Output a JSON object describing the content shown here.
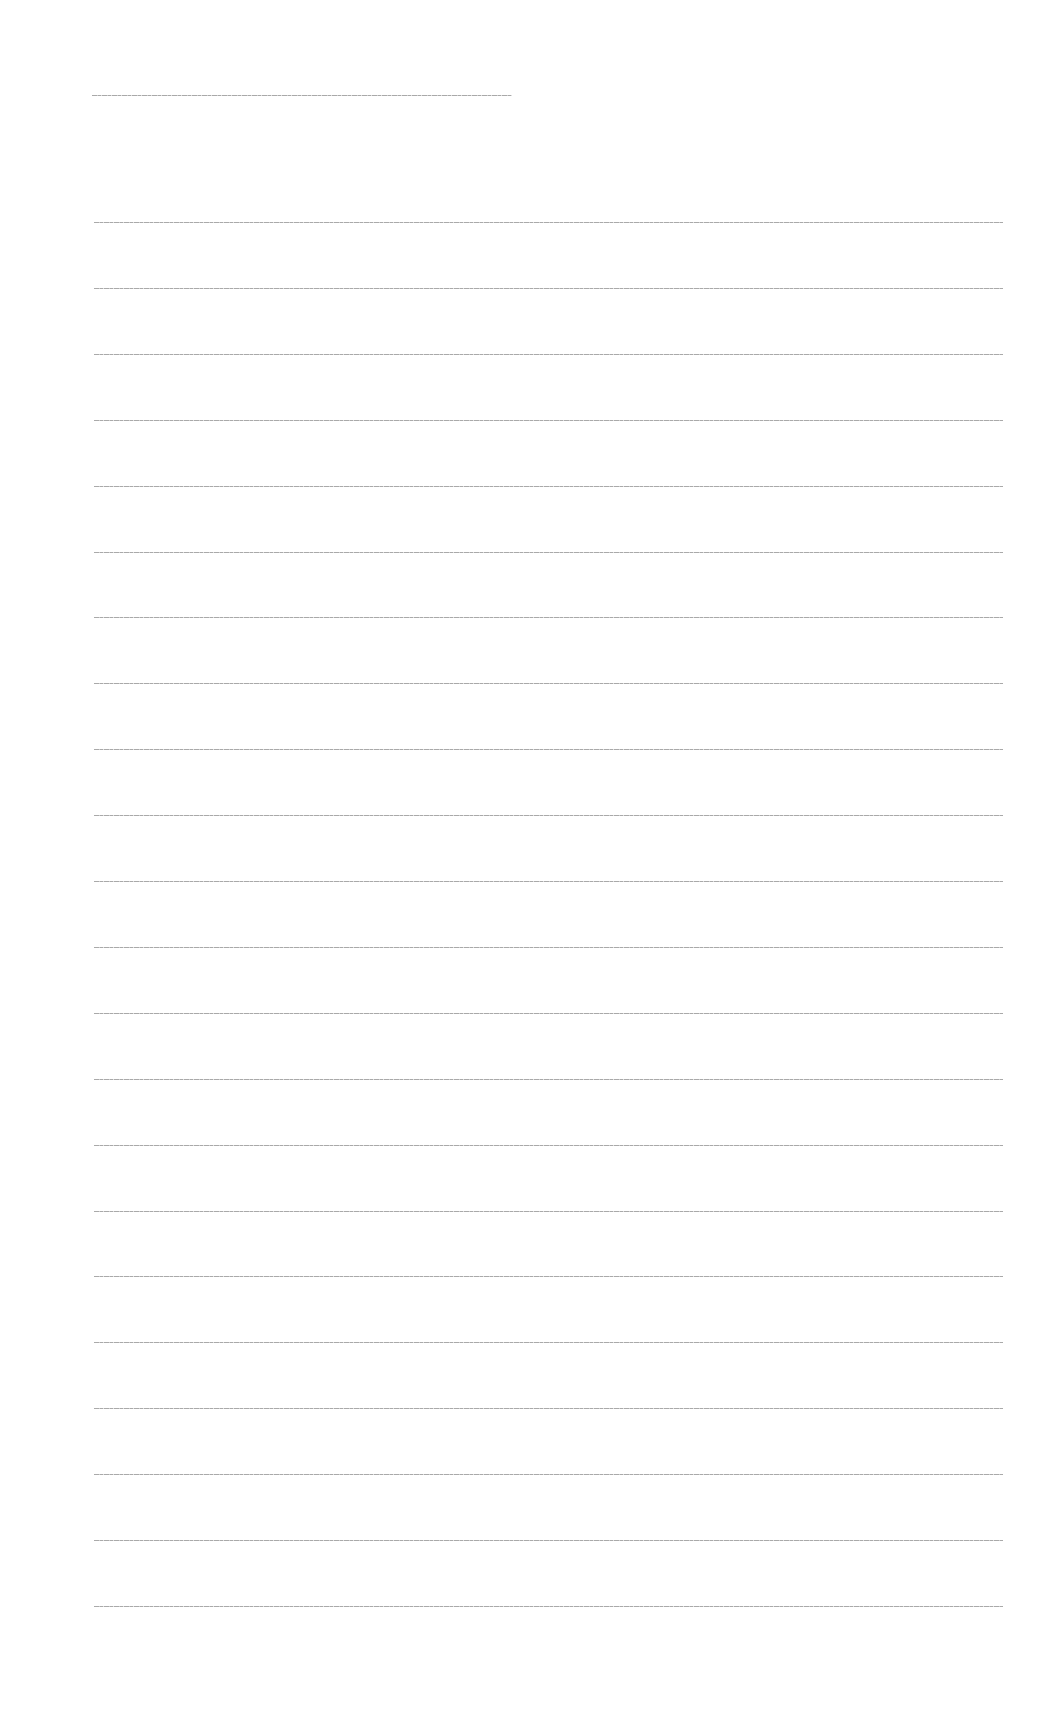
{
  "page": {
    "type": "blank lined sheet",
    "background_color": "#ffffff",
    "rule_color": "#9a9a9a"
  },
  "header_rule": {
    "x": 92,
    "y": 95,
    "width": 420
  },
  "body_rules": {
    "count": 22,
    "x": 94,
    "first_y": 222,
    "spacing": 65.9,
    "width": 909
  },
  "text_content": []
}
